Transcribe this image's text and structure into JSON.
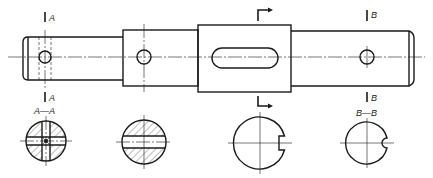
{
  "drawing": {
    "title": "Shaft with cross-sections",
    "type": "engineering-technical-drawing",
    "colors": {
      "line": "#1a1a1a",
      "background": "#ffffff"
    },
    "main_view": {
      "segments": [
        {
          "name": "left-journal",
          "x": 23,
          "w": 100,
          "top": 37,
          "bottom": 80
        },
        {
          "name": "middle-step",
          "x": 123,
          "w": 75,
          "top": 30,
          "bottom": 86
        },
        {
          "name": "keyway-collar",
          "x": 198,
          "w": 93,
          "top": 25,
          "bottom": 92
        },
        {
          "name": "right-journal",
          "x": 291,
          "w": 123,
          "top": 31,
          "bottom": 86
        }
      ],
      "holes": [
        {
          "name": "cross-hole-a",
          "cx": 45,
          "cy": 57,
          "r": 6
        },
        {
          "name": "hole-middle",
          "cx": 144,
          "cy": 57,
          "r": 7
        },
        {
          "name": "cross-hole-b",
          "cx": 367,
          "cy": 57,
          "r": 7
        }
      ],
      "slot": {
        "x": 212,
        "y": 48,
        "w": 66,
        "h": 20
      }
    },
    "section_marks": {
      "a_top": "A",
      "a_bottom": "A",
      "b_top": "B",
      "b_bottom": "B"
    },
    "section_views": [
      {
        "name": "section-a-a",
        "label": "A—A",
        "cx": 46,
        "cy": 141,
        "r": 20
      },
      {
        "name": "section-middle",
        "label": "",
        "cx": 144,
        "cy": 142,
        "r": 22
      },
      {
        "name": "section-keyway",
        "label": "",
        "cx": 260,
        "cy": 143,
        "r": 26
      },
      {
        "name": "section-b-b",
        "label": "B—B",
        "cx": 367,
        "cy": 143,
        "r": 21
      }
    ]
  }
}
